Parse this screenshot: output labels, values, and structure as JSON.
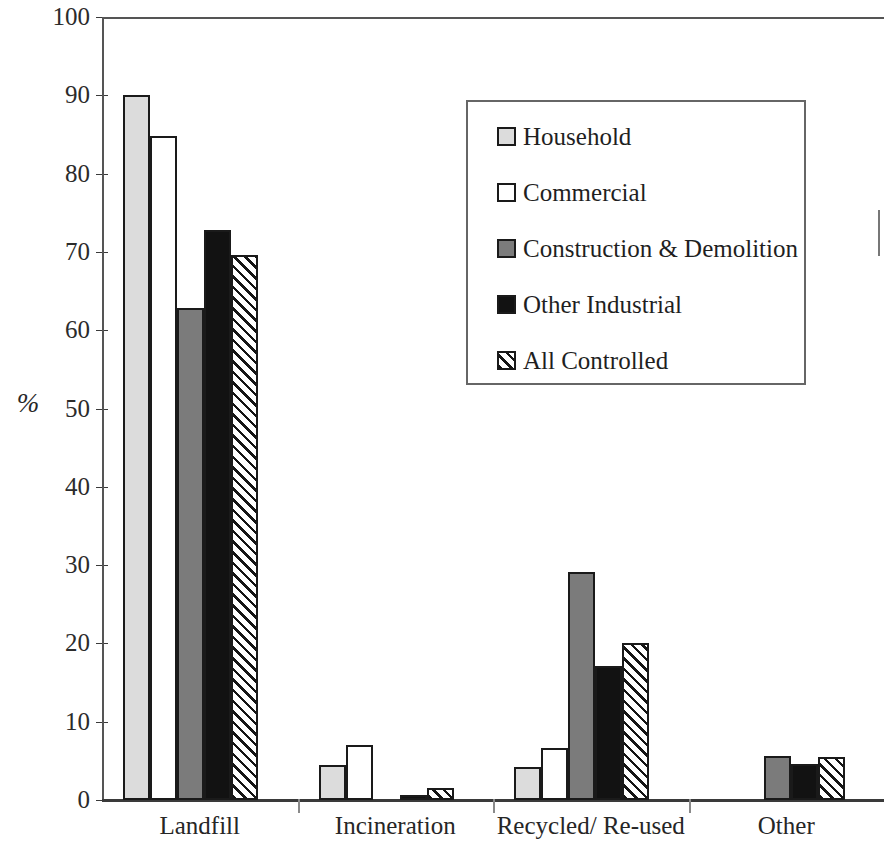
{
  "chart_data": {
    "type": "bar",
    "title": "",
    "subtitle": "",
    "xlabel": "",
    "ylabel": "%",
    "ylim": [
      0,
      100
    ],
    "ytick_step": 10,
    "yticks": [
      100,
      90,
      80,
      70,
      60,
      50,
      40,
      30,
      20,
      10,
      0
    ],
    "ytick_labels": [
      "100",
      "90",
      "80",
      "70",
      "60",
      "50",
      "40",
      "30",
      "20",
      "10",
      "0"
    ],
    "grid": false,
    "legend_position": "upper-right-inside",
    "categories": [
      "Landfill",
      "Incineration",
      "Recycled/ Re-used",
      "Other"
    ],
    "series": [
      {
        "name": "Household",
        "fill": "fill-lightgray",
        "color": "#dcdcdc",
        "values": [
          90.0,
          4.5,
          4.2,
          0.0
        ]
      },
      {
        "name": "Commercial",
        "fill": "fill-white",
        "color": "#ffffff",
        "values": [
          84.8,
          7.0,
          6.6,
          0.0
        ]
      },
      {
        "name": "Construction & Demolition",
        "fill": "fill-midgray",
        "color": "#7b7b7b",
        "values": [
          62.8,
          0.0,
          29.1,
          5.6
        ]
      },
      {
        "name": "Other Industrial",
        "fill": "fill-black",
        "color": "#121212",
        "values": [
          72.8,
          0.6,
          17.1,
          4.6
        ]
      },
      {
        "name": "All Controlled",
        "fill": "fill-hatch",
        "color": "#ffffff",
        "values": [
          69.6,
          1.5,
          20.0,
          5.5
        ]
      }
    ]
  },
  "axes": {
    "y_title": "%"
  },
  "legend": {
    "entries": [
      {
        "label": "Household",
        "fill": "fill-lightgray"
      },
      {
        "label": "Commercial",
        "fill": "fill-white"
      },
      {
        "label": "Construction & Demolition",
        "fill": "fill-midgray"
      },
      {
        "label": "Other Industrial",
        "fill": "fill-black"
      },
      {
        "label": "All Controlled",
        "fill": "fill-hatch"
      }
    ]
  }
}
